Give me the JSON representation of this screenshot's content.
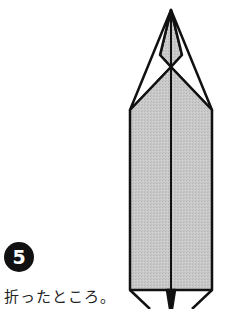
{
  "step": {
    "number": "5",
    "caption": "折ったところ。"
  },
  "diagram": {
    "fill_color": "#c8c8c8",
    "line_color": "#111111"
  }
}
